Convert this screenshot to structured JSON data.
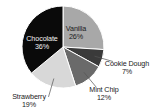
{
  "chart_data": {
    "type": "pie",
    "title": "",
    "subtitle": "",
    "xlabel": "",
    "ylabel": "",
    "legend_position": "none",
    "grid": false,
    "categories": [
      "Vanilla",
      "Cookie Dough",
      "Mint Chip",
      "Strawberry",
      "Chocolate"
    ],
    "values": [
      26,
      7,
      12,
      19,
      36
    ],
    "value_suffix": "%",
    "slices": [
      {
        "name": "Vanilla",
        "percent": 26,
        "percent_text": "26%",
        "color": "#a8a8a8",
        "label_placement": "inside",
        "label_text_color": "#1a1a1a",
        "leader_line": false
      },
      {
        "name": "Cookie Dough",
        "percent": 7,
        "percent_text": "7%",
        "color": "#3a3a3a",
        "label_placement": "outside",
        "label_text_color": "#1a1a1a",
        "leader_line": true
      },
      {
        "name": "Mint Chip",
        "percent": 12,
        "percent_text": "12%",
        "color": "#6a6a6a",
        "label_placement": "outside",
        "label_text_color": "#1a1a1a",
        "leader_line": true
      },
      {
        "name": "Strawberry",
        "percent": 19,
        "percent_text": "19%",
        "color": "#d8d8d8",
        "label_placement": "outside",
        "label_text_color": "#1a1a1a",
        "leader_line": true
      },
      {
        "name": "Chocolate",
        "percent": 36,
        "percent_text": "36%",
        "color": "#0a0a0a",
        "label_placement": "inside",
        "label_text_color": "#f2f2f2",
        "leader_line": false
      }
    ],
    "geometry": {
      "center_x": 63,
      "center_y": 47,
      "radius": 41,
      "start_angle_deg": -90,
      "direction": "clockwise"
    },
    "style": {
      "background": "#ffffff",
      "slice_border_color": "#ffffff",
      "leader_line_color": "#555555"
    }
  }
}
